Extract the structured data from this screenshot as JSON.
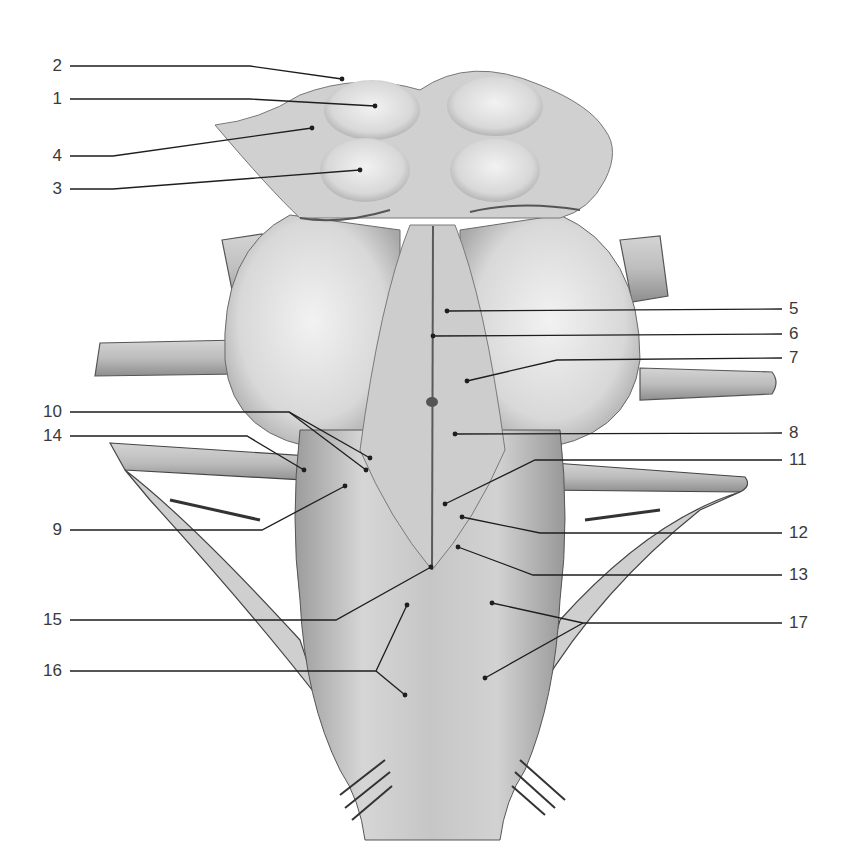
{
  "figure": {
    "line_color": "#1e1e1e",
    "fill_light": "#e4e4e4",
    "fill_mid": "#c2c2c2",
    "fill_dark": "#8a8a8a"
  },
  "labels": [
    {
      "id": "1",
      "text": "1",
      "side": "left",
      "x": 24,
      "y": 99,
      "leader": [
        [
          70,
          99
        ],
        [
          250,
          99
        ],
        [
          375,
          106
        ]
      ]
    },
    {
      "id": "2",
      "text": "2",
      "side": "left",
      "x": 24,
      "y": 66,
      "leader": [
        [
          70,
          66
        ],
        [
          250,
          66
        ],
        [
          342,
          79
        ]
      ]
    },
    {
      "id": "3",
      "text": "3",
      "side": "left",
      "x": 24,
      "y": 189,
      "leader": [
        [
          70,
          189
        ],
        [
          113,
          189
        ],
        [
          360,
          170
        ]
      ]
    },
    {
      "id": "4",
      "text": "4",
      "side": "left",
      "x": 24,
      "y": 156,
      "leader": [
        [
          70,
          156
        ],
        [
          113,
          156
        ],
        [
          312,
          128
        ]
      ]
    },
    {
      "id": "5",
      "text": "5",
      "side": "right",
      "x": 789,
      "y": 309,
      "leader": [
        [
          782,
          309
        ],
        [
          447,
          311
        ]
      ]
    },
    {
      "id": "6",
      "text": "6",
      "side": "right",
      "x": 789,
      "y": 334,
      "leader": [
        [
          782,
          334
        ],
        [
          433,
          336
        ]
      ]
    },
    {
      "id": "7",
      "text": "7",
      "side": "right",
      "x": 789,
      "y": 358,
      "leader": [
        [
          782,
          358
        ],
        [
          557,
          360
        ],
        [
          467,
          381
        ]
      ]
    },
    {
      "id": "8",
      "text": "8",
      "side": "right",
      "x": 789,
      "y": 433,
      "leader": [
        [
          782,
          433
        ],
        [
          455,
          434
        ]
      ]
    },
    {
      "id": "9",
      "text": "9",
      "side": "left",
      "x": 24,
      "y": 530,
      "leader": [
        [
          70,
          530
        ],
        [
          262,
          530
        ],
        [
          345,
          486
        ]
      ]
    },
    {
      "id": "10",
      "text": "10",
      "side": "left",
      "x": 24,
      "y": 412,
      "leader": [
        [
          70,
          412
        ],
        [
          289,
          412
        ],
        [
          370,
          458
        ]
      ],
      "leader2": [
        [
          289,
          412
        ],
        [
          366,
          470
        ]
      ]
    },
    {
      "id": "11",
      "text": "11",
      "side": "right",
      "x": 789,
      "y": 460,
      "leader": [
        [
          782,
          460
        ],
        [
          535,
          460
        ],
        [
          445,
          504
        ]
      ]
    },
    {
      "id": "12",
      "text": "12",
      "side": "right",
      "x": 789,
      "y": 533,
      "leader": [
        [
          782,
          533
        ],
        [
          540,
          533
        ],
        [
          462,
          517
        ]
      ]
    },
    {
      "id": "13",
      "text": "13",
      "side": "right",
      "x": 789,
      "y": 575,
      "leader": [
        [
          782,
          575
        ],
        [
          533,
          575
        ],
        [
          458,
          547
        ]
      ]
    },
    {
      "id": "14",
      "text": "14",
      "side": "left",
      "x": 24,
      "y": 436,
      "leader": [
        [
          70,
          436
        ],
        [
          247,
          436
        ],
        [
          304,
          470
        ]
      ]
    },
    {
      "id": "15",
      "text": "15",
      "side": "left",
      "x": 24,
      "y": 620,
      "leader": [
        [
          70,
          620
        ],
        [
          336,
          620
        ],
        [
          431,
          567
        ]
      ]
    },
    {
      "id": "16",
      "text": "16",
      "side": "left",
      "x": 24,
      "y": 671,
      "leader": [
        [
          70,
          671
        ],
        [
          376,
          671
        ],
        [
          407,
          605
        ]
      ],
      "leader2": [
        [
          376,
          671
        ],
        [
          405,
          695
        ]
      ]
    },
    {
      "id": "17",
      "text": "17",
      "side": "right",
      "x": 789,
      "y": 623,
      "leader": [
        [
          782,
          623
        ],
        [
          583,
          623
        ],
        [
          492,
          603
        ]
      ],
      "leader2": [
        [
          583,
          623
        ],
        [
          485,
          678
        ]
      ]
    }
  ]
}
